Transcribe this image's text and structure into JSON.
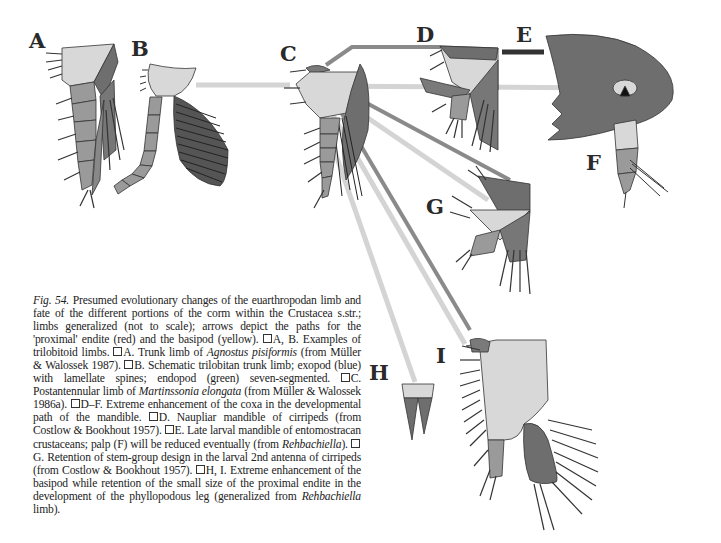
{
  "figure": {
    "labels": {
      "A": "A",
      "B": "B",
      "C": "C",
      "D": "D",
      "E": "E",
      "F": "F",
      "G": "G",
      "H": "H",
      "I": "I"
    },
    "colors": {
      "endite_red_gray": "#7a7a7a",
      "basipod_yellow_gray": "#d8d8d8",
      "coxa_dark": "#6e6e6e",
      "exopod_blue_gray": "#555555",
      "endopod_green_gray": "#9a9a9a",
      "arrow_light": "#d4d4d4",
      "arrow_dark": "#8a8a8a",
      "arrow_black": "#333333"
    }
  },
  "caption": {
    "fig_ref": "Fig. 54.",
    "text_1": " Presumed evolutionary changes of the euarthropodan limb and fate of the different portions of the corm within the Crustacea s.str.; limbs generalized (not to scale); arrows depict the paths for the 'proximal' endite (red) and the basipod (yellow). ",
    "A_B": "A, B. Examples of trilobitoid limbs. ",
    "A_pre": "A. Trunk limb of ",
    "A_species": "Agnostus pisiformis",
    "A_post": " (from Müller & Walossek 1987). ",
    "B": "B. Schematic trilobitan trunk limb; exopod (blue) with lamellate spines; endopod (green) seven-segmented. ",
    "C_pre": "C. Postantennular limb of ",
    "C_species": "Martinssonia elongata",
    "C_post": " (from Müller & Walossek 1986a). ",
    "D_F": "D–F. Extreme enhancement of the coxa in the developmental path of the mandible. ",
    "D": "D. Naupliar mandible of cirripeds (from Costlow & Bookhout 1957). ",
    "E_pre": "E. Late larval mandible of entomostracan crustaceans; palp (F) will be reduced eventually (from ",
    "E_genus": "Rehbachiella",
    "E_post": "). ",
    "G": "G. Retention of stem-group design in the larval 2nd antenna of cirripeds (from Costlow & Bookhout 1957). ",
    "H_I_pre": "H, I. Extreme enhancement of the basipod while retention of the small size of the proximal endite in the development of the phyllopodous leg (generalized from ",
    "H_I_genus": "Rehbachiella",
    "H_I_post": " limb)."
  }
}
